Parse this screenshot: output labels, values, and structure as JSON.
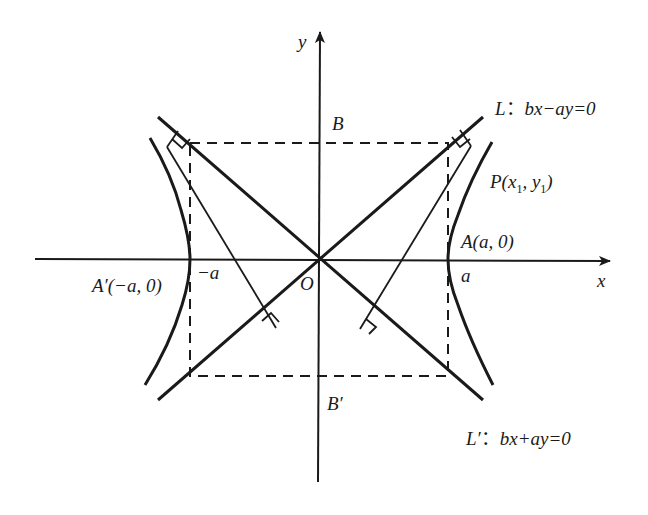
{
  "figure": {
    "type": "hyperbola-diagram",
    "colors": {
      "stroke": "#1a1a1a",
      "background": "#ffffff"
    }
  },
  "axes": {
    "x_label": "x",
    "y_label": "y",
    "origin_label": "O"
  },
  "labels": {
    "B": "B",
    "B_prime": "B′",
    "neg_a": "−a",
    "a": "a",
    "A": "A(a, 0)",
    "A_prime": "A′(−a, 0)",
    "P_main": "P(x",
    "P_sub1": "1",
    "P_mid": ", y",
    "P_sub2": "1",
    "P_end": ")",
    "L_name": "L",
    "L_colon": "：",
    "L_eq": "bx−ay=0",
    "Lp_name": "L′",
    "Lp_colon": "：",
    "Lp_eq": "bx+ay=0"
  }
}
